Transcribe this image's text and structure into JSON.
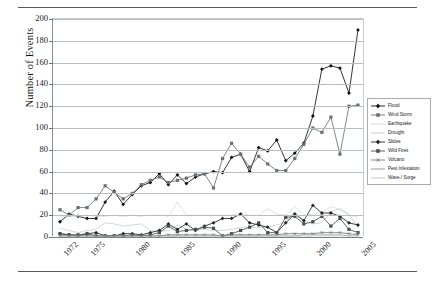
{
  "figure": {
    "name": "number-of-events-by-disaster-type",
    "ylabel": "Number of Events"
  },
  "chart_data": {
    "type": "line",
    "title": "",
    "xlabel": "",
    "ylabel": "Number of Events",
    "ylim": [
      0,
      200
    ],
    "ytick_step": 20,
    "yticks": [
      0,
      20,
      40,
      60,
      80,
      100,
      120,
      140,
      160,
      180,
      200
    ],
    "grid": "horizontal",
    "legend_position": "right",
    "x": [
      1972,
      1973,
      1974,
      1975,
      1976,
      1977,
      1978,
      1979,
      1980,
      1981,
      1982,
      1983,
      1984,
      1985,
      1986,
      1987,
      1988,
      1989,
      1990,
      1991,
      1992,
      1993,
      1994,
      1995,
      1996,
      1997,
      1998,
      1999,
      2000,
      2001,
      2002,
      2003,
      2004,
      2005
    ],
    "xtick_labels": [
      "1972",
      "1975",
      "1980",
      "1985",
      "1990",
      "1995",
      "2000",
      "2005"
    ],
    "xtick_values": [
      1972,
      1975,
      1980,
      1985,
      1990,
      1995,
      2000,
      2005
    ],
    "series": [
      {
        "name": "Flood",
        "marker": "diamond",
        "color": "#111111",
        "values": [
          14,
          21,
          19,
          17,
          17,
          32,
          42,
          30,
          39,
          47,
          50,
          58,
          48,
          57,
          49,
          55,
          58,
          60,
          59,
          73,
          76,
          60,
          82,
          79,
          89,
          70,
          77,
          86,
          111,
          154,
          157,
          155,
          132,
          190
        ]
      },
      {
        "name": "Wind Storm",
        "marker": "square",
        "color": "#6d7073",
        "values": [
          25,
          20,
          27,
          27,
          35,
          47,
          41,
          35,
          40,
          48,
          52,
          55,
          50,
          52,
          54,
          57,
          58,
          45,
          72,
          86,
          76,
          64,
          74,
          67,
          61,
          61,
          72,
          85,
          100,
          96,
          110,
          76,
          120,
          121
        ]
      },
      {
        "name": "Earthquake",
        "marker": "none",
        "color": "#d2d4d6",
        "values": [
          19,
          19,
          19,
          20,
          19,
          19,
          20,
          19,
          20,
          19,
          20,
          20,
          19,
          32,
          20,
          20,
          20,
          20,
          20,
          20,
          22,
          20,
          20,
          26,
          21,
          20,
          28,
          20,
          21,
          22,
          28,
          25,
          20,
          18
        ]
      },
      {
        "name": "Drought",
        "marker": "none",
        "color": "#c4c6c9",
        "values": [
          8,
          6,
          4,
          6,
          7,
          13,
          12,
          10,
          11,
          12,
          6,
          5,
          6,
          11,
          7,
          6,
          7,
          6,
          6,
          7,
          9,
          9,
          9,
          9,
          11,
          14,
          23,
          15,
          12,
          13,
          23,
          26,
          21,
          9
        ]
      },
      {
        "name": "Slides",
        "marker": "diamond",
        "color": "#222222",
        "values": [
          3,
          2,
          1,
          3,
          4,
          1,
          1,
          3,
          3,
          2,
          4,
          6,
          12,
          7,
          12,
          6,
          10,
          13,
          17,
          17,
          21,
          13,
          11,
          9,
          4,
          13,
          21,
          15,
          29,
          22,
          22,
          19,
          13,
          11
        ]
      },
      {
        "name": "Wild Fires",
        "marker": "square",
        "color": "#4a4d50",
        "values": [
          3,
          2,
          2,
          3,
          1,
          1,
          1,
          1,
          2,
          1,
          2,
          4,
          10,
          5,
          6,
          7,
          9,
          8,
          1,
          3,
          6,
          9,
          13,
          4,
          4,
          18,
          19,
          12,
          14,
          19,
          10,
          17,
          7,
          4
        ]
      },
      {
        "name": "Volcano",
        "marker": "cross",
        "color": "#77797c",
        "values": [
          1,
          1,
          1,
          1,
          1,
          1,
          1,
          1,
          1,
          1,
          1,
          1,
          2,
          2,
          2,
          2,
          2,
          2,
          1,
          2,
          2,
          2,
          2,
          2,
          2,
          3,
          3,
          3,
          3,
          4,
          4,
          4,
          3,
          2
        ]
      },
      {
        "name": "Pest Infestation",
        "marker": "none",
        "color": "#8e9093",
        "values": [
          1,
          1,
          1,
          1,
          1,
          1,
          1,
          1,
          1,
          1,
          1,
          1,
          1,
          1,
          1,
          1,
          1,
          1,
          1,
          1,
          1,
          1,
          1,
          1,
          1,
          1,
          1,
          2,
          2,
          2,
          2,
          2,
          1,
          1
        ]
      },
      {
        "name": "Wave / Surge",
        "marker": "none",
        "color": "#bcbec1",
        "values": [
          0,
          0,
          0,
          0,
          0,
          0,
          0,
          0,
          0,
          0,
          0,
          0,
          0,
          1,
          0,
          0,
          0,
          0,
          0,
          0,
          1,
          0,
          1,
          1,
          0,
          0,
          1,
          0,
          1,
          1,
          1,
          1,
          1,
          4
        ]
      }
    ]
  }
}
